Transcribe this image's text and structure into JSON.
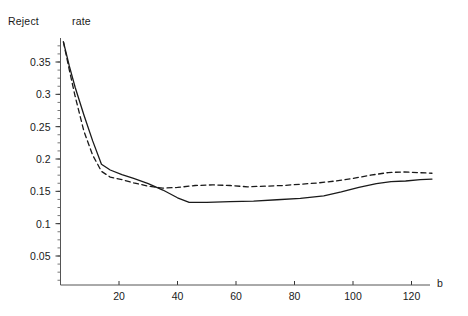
{
  "chart_data": {
    "type": "line",
    "title": "Reject   rate",
    "title_words": {
      "first": "Reject",
      "second": "rate"
    },
    "xlabel": "b",
    "ylabel": "",
    "xlim": [
      0,
      128
    ],
    "ylim": [
      0,
      0.395
    ],
    "grid": false,
    "legend": "none",
    "xticks": [
      20,
      40,
      60,
      80,
      100,
      120
    ],
    "xticklabels": [
      "20",
      "40",
      "60",
      "80",
      "100",
      "120"
    ],
    "yticks": [
      0.05,
      0.1,
      0.15,
      0.2,
      0.25,
      0.3,
      0.35
    ],
    "yticklabels": [
      "0.05",
      "0.1",
      "0.15",
      "0.2",
      "0.25",
      "0.3",
      "0.35"
    ],
    "series": [
      {
        "name": "solid",
        "style": "solid",
        "color": "#1a1a1a",
        "x": [
          1,
          3,
          5,
          8,
          11,
          14,
          17,
          21,
          25,
          30,
          35,
          40,
          44,
          50,
          58,
          66,
          74,
          82,
          90,
          96,
          102,
          108,
          113,
          118,
          123,
          127
        ],
        "y": [
          0.381,
          0.344,
          0.311,
          0.268,
          0.228,
          0.192,
          0.183,
          0.176,
          0.17,
          0.162,
          0.152,
          0.14,
          0.133,
          0.133,
          0.134,
          0.135,
          0.137,
          0.139,
          0.143,
          0.149,
          0.156,
          0.162,
          0.165,
          0.166,
          0.168,
          0.169
        ]
      },
      {
        "name": "dashed",
        "style": "dashed",
        "color": "#1a1a1a",
        "x": [
          1,
          3,
          5,
          8,
          11,
          14,
          17,
          21,
          25,
          30,
          35,
          40,
          46,
          52,
          58,
          64,
          70,
          76,
          82,
          88,
          94,
          100,
          106,
          112,
          117,
          122,
          127
        ],
        "y": [
          0.381,
          0.338,
          0.297,
          0.243,
          0.206,
          0.181,
          0.172,
          0.168,
          0.163,
          0.158,
          0.155,
          0.156,
          0.159,
          0.16,
          0.159,
          0.157,
          0.158,
          0.159,
          0.161,
          0.163,
          0.166,
          0.17,
          0.175,
          0.179,
          0.18,
          0.179,
          0.178
        ]
      }
    ]
  }
}
